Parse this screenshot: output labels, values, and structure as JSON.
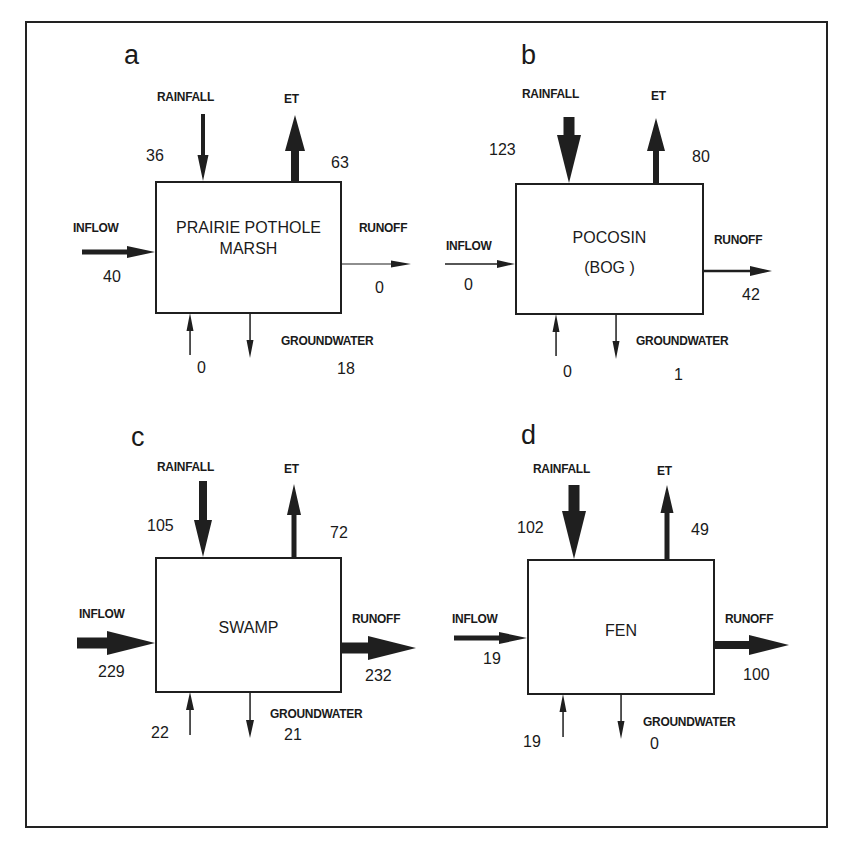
{
  "figure": {
    "colors": {
      "ink": "#1f1f1f",
      "background": "#ffffff"
    }
  },
  "panels": [
    {
      "letter": "a",
      "name": "PRAIRIE POTHOLE MARSH",
      "title_lines": [
        "PRAIRIE POTHOLE",
        "MARSH"
      ],
      "labels": {
        "rainfall": "RAINFALL",
        "et": "ET",
        "inflow": "INFLOW",
        "runoff": "RUNOFF",
        "groundwater": "GROUNDWATER"
      },
      "values": {
        "rainfall": "36",
        "et": "63",
        "inflow": "40",
        "runoff": "0",
        "groundwater_in": "0",
        "groundwater_out": "18"
      }
    },
    {
      "letter": "b",
      "name": "POCOSIN (BOG)",
      "title_lines": [
        "POCOSIN",
        "(BOG )"
      ],
      "labels": {
        "rainfall": "RAINFALL",
        "et": "ET",
        "inflow": "INFLOW",
        "runoff": "RUNOFF",
        "groundwater": "GROUNDWATER"
      },
      "values": {
        "rainfall": "123",
        "et": "80",
        "inflow": "0",
        "runoff": "42",
        "groundwater_in": "0",
        "groundwater_out": "1"
      }
    },
    {
      "letter": "c",
      "name": "SWAMP",
      "title_lines": [
        "SWAMP"
      ],
      "labels": {
        "rainfall": "RAINFALL",
        "et": "ET",
        "inflow": "INFLOW",
        "runoff": "RUNOFF",
        "groundwater": "GROUNDWATER"
      },
      "values": {
        "rainfall": "105",
        "et": "72",
        "inflow": "229",
        "runoff": "232",
        "groundwater_in": "22",
        "groundwater_out": "21"
      }
    },
    {
      "letter": "d",
      "name": "FEN",
      "title_lines": [
        "FEN"
      ],
      "labels": {
        "rainfall": "RAINFALL",
        "et": "ET",
        "inflow": "INFLOW",
        "runoff": "RUNOFF",
        "groundwater": "GROUNDWATER"
      },
      "values": {
        "rainfall": "102",
        "et": "49",
        "inflow": "19",
        "runoff": "100",
        "groundwater_in": "19",
        "groundwater_out": "0"
      }
    }
  ],
  "arrows": [
    {
      "panel": 0,
      "flow": "rainfall",
      "x1": 203,
      "y1": 114,
      "x2": 203,
      "y2": 181,
      "shaft": 4,
      "head_w": 11,
      "head_l": 26
    },
    {
      "panel": 0,
      "flow": "et",
      "x1": 295,
      "y1": 181,
      "x2": 295,
      "y2": 115,
      "shaft": 8,
      "head_w": 20,
      "head_l": 36
    },
    {
      "panel": 0,
      "flow": "inflow",
      "x1": 82,
      "y1": 252,
      "x2": 155,
      "y2": 252,
      "shaft": 5,
      "head_w": 12,
      "head_l": 28
    },
    {
      "panel": 0,
      "flow": "runoff",
      "x1": 341,
      "y1": 264,
      "x2": 411,
      "y2": 264,
      "shaft": 1.2,
      "head_w": 7,
      "head_l": 20
    },
    {
      "panel": 0,
      "flow": "groundwater_in",
      "x1": 190,
      "y1": 355,
      "x2": 190,
      "y2": 313,
      "shaft": 1.5,
      "head_w": 7,
      "head_l": 18
    },
    {
      "panel": 0,
      "flow": "groundwater_out",
      "x1": 250,
      "y1": 313,
      "x2": 250,
      "y2": 358,
      "shaft": 1.5,
      "head_w": 7,
      "head_l": 18
    },
    {
      "panel": 1,
      "flow": "rainfall",
      "x1": 569,
      "y1": 117,
      "x2": 569,
      "y2": 183,
      "shaft": 11,
      "head_w": 24,
      "head_l": 48
    },
    {
      "panel": 1,
      "flow": "et",
      "x1": 656,
      "y1": 183,
      "x2": 656,
      "y2": 118,
      "shaft": 6,
      "head_w": 18,
      "head_l": 33
    },
    {
      "panel": 1,
      "flow": "inflow",
      "x1": 445,
      "y1": 264,
      "x2": 515,
      "y2": 264,
      "shaft": 1.5,
      "head_w": 8,
      "head_l": 18
    },
    {
      "panel": 1,
      "flow": "runoff",
      "x1": 703,
      "y1": 271,
      "x2": 772,
      "y2": 271,
      "shaft": 2.5,
      "head_w": 10,
      "head_l": 22
    },
    {
      "panel": 1,
      "flow": "groundwater_in",
      "x1": 556,
      "y1": 356,
      "x2": 556,
      "y2": 314,
      "shaft": 1.5,
      "head_w": 7,
      "head_l": 18
    },
    {
      "panel": 1,
      "flow": "groundwater_out",
      "x1": 616,
      "y1": 314,
      "x2": 616,
      "y2": 359,
      "shaft": 1.5,
      "head_w": 7,
      "head_l": 18
    },
    {
      "panel": 2,
      "flow": "rainfall",
      "x1": 203,
      "y1": 481,
      "x2": 203,
      "y2": 557,
      "shaft": 8,
      "head_w": 18,
      "head_l": 37
    },
    {
      "panel": 2,
      "flow": "et",
      "x1": 294,
      "y1": 557,
      "x2": 294,
      "y2": 484,
      "shaft": 5,
      "head_w": 14,
      "head_l": 31
    },
    {
      "panel": 2,
      "flow": "inflow",
      "x1": 77,
      "y1": 643,
      "x2": 155,
      "y2": 643,
      "shaft": 11,
      "head_w": 24,
      "head_l": 48
    },
    {
      "panel": 2,
      "flow": "runoff",
      "x1": 341,
      "y1": 648,
      "x2": 416,
      "y2": 648,
      "shaft": 11,
      "head_w": 24,
      "head_l": 48
    },
    {
      "panel": 2,
      "flow": "groundwater_in",
      "x1": 190,
      "y1": 735,
      "x2": 190,
      "y2": 692,
      "shaft": 1.5,
      "head_w": 8,
      "head_l": 18
    },
    {
      "panel": 2,
      "flow": "groundwater_out",
      "x1": 250,
      "y1": 692,
      "x2": 250,
      "y2": 738,
      "shaft": 1.5,
      "head_w": 8,
      "head_l": 18
    },
    {
      "panel": 3,
      "flow": "rainfall",
      "x1": 574,
      "y1": 485,
      "x2": 574,
      "y2": 559,
      "shaft": 11,
      "head_w": 24,
      "head_l": 48
    },
    {
      "panel": 3,
      "flow": "et",
      "x1": 667,
      "y1": 559,
      "x2": 667,
      "y2": 485,
      "shaft": 5,
      "head_w": 13,
      "head_l": 28
    },
    {
      "panel": 3,
      "flow": "inflow",
      "x1": 454,
      "y1": 638,
      "x2": 527,
      "y2": 638,
      "shaft": 5,
      "head_w": 12,
      "head_l": 28
    },
    {
      "panel": 3,
      "flow": "runoff",
      "x1": 714,
      "y1": 645,
      "x2": 789,
      "y2": 645,
      "shaft": 8,
      "head_w": 20,
      "head_l": 40
    },
    {
      "panel": 3,
      "flow": "groundwater_in",
      "x1": 563,
      "y1": 737,
      "x2": 563,
      "y2": 694,
      "shaft": 1.5,
      "head_w": 7,
      "head_l": 18
    },
    {
      "panel": 3,
      "flow": "groundwater_out",
      "x1": 621,
      "y1": 694,
      "x2": 621,
      "y2": 739,
      "shaft": 1.5,
      "head_w": 7,
      "head_l": 18
    }
  ]
}
